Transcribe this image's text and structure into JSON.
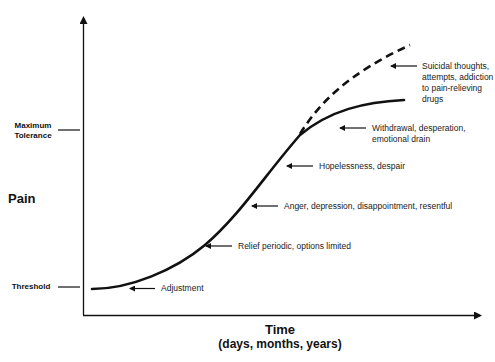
{
  "diagram": {
    "y_axis_label": "Pain",
    "x_axis_label": "Time",
    "x_axis_sublabel": "(days, months, years)",
    "y_levels": [
      {
        "label_line1": "Maximum",
        "label_line2": "Tolerance"
      },
      {
        "label_line1": "Threshold",
        "label_line2": ""
      }
    ],
    "stages": [
      {
        "label": "Adjustment"
      },
      {
        "label": "Relief periodic, options limited"
      },
      {
        "label": "Anger, depression, disappointment, resentful"
      },
      {
        "label": "Hopelessness, despair"
      },
      {
        "label_lines": [
          "Withdrawal, desperation,",
          "emotional drain"
        ]
      },
      {
        "label_lines": [
          "Suicidal thoughts,",
          "attempts, addiction",
          "to pain-relieving",
          "drugs"
        ]
      }
    ],
    "curves": [
      {
        "name": "main-pain-curve",
        "style": "solid",
        "description": "pain rises from threshold toward maximum tolerance"
      },
      {
        "name": "escalation-curve",
        "style": "dashed",
        "description": "pain exceeds maximum tolerance"
      }
    ],
    "line_color": "#111111"
  }
}
